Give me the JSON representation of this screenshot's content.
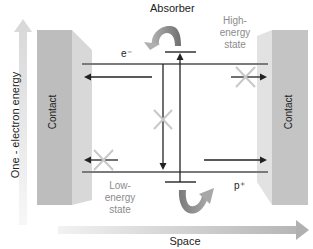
{
  "diagram": {
    "title": "Absorber",
    "y_axis_label": "One - electron energy",
    "x_axis_label": "Space",
    "left_contact_label": "Contact",
    "right_contact_label": "Contact",
    "high_state_label": [
      "High-",
      "energy",
      "state"
    ],
    "low_state_label": [
      "Low-",
      "energy",
      "state"
    ],
    "electron_label": "e⁻",
    "hole_label": "p⁺",
    "colors": {
      "contact_face": "#b8b8b8",
      "contact_side": "#d6d6d6",
      "energy_line": "#7a7a7a",
      "arrow": "#222222",
      "blocked_x": "#c8c8c8",
      "curved_arrow": "#8a8a8a",
      "axis_arrow": "#cfcfcf",
      "muted_text": "#8c8c8c"
    }
  }
}
